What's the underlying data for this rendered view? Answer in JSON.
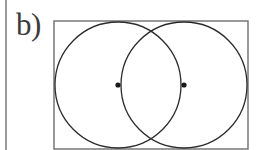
{
  "figure": {
    "panel_label": "b)",
    "colors": {
      "stroke": "#2b2b2b",
      "frame_stroke": "#6e6e6e",
      "gutter_rule": "#9a9a9a",
      "label_text": "#3c3c3c",
      "background": "#ffffff",
      "dot_fill": "#1a1a1a"
    },
    "frame": {
      "name": "bounding-rectangle",
      "x": 54,
      "y": 21,
      "width": 194,
      "height": 128,
      "stroke_width": 1.4
    },
    "circles": [
      {
        "name": "left-circle",
        "cx": 118,
        "cy": 85,
        "r": 63,
        "stroke_width": 1.3
      },
      {
        "name": "right-circle",
        "cx": 184,
        "cy": 85,
        "r": 63,
        "stroke_width": 1.3
      }
    ],
    "centre_dots": [
      {
        "name": "left-centre-dot",
        "cx": 118,
        "cy": 85,
        "r": 2.6
      },
      {
        "name": "right-centre-dot",
        "cx": 184,
        "cy": 85,
        "r": 2.6
      }
    ],
    "gutter_rule": {
      "name": "page-gutter-rule",
      "x": 5,
      "y": 0,
      "width": 2,
      "height": 150
    }
  }
}
